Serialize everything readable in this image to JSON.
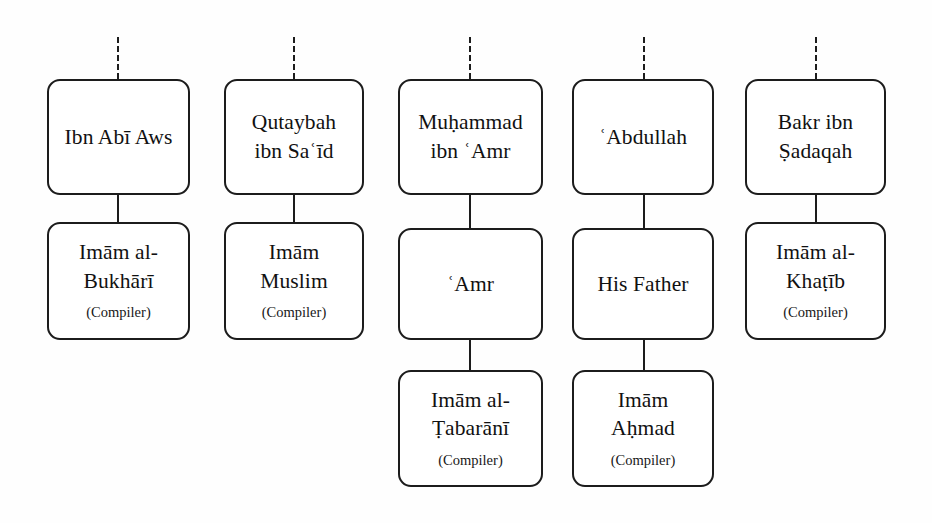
{
  "diagram": {
    "type": "isnad-chain-diagram",
    "background_color": "#fefefe",
    "box_border_color": "#1c1c1c",
    "box_fill_color": "#ffffff",
    "text_color": "#111111",
    "role_label": "(Compiler)",
    "chains": [
      {
        "id": "chain-1",
        "nodes": [
          {
            "name": "Ibn Abī Aws",
            "role": ""
          },
          {
            "name": "Imām al-\nBukhārī",
            "role": "(Compiler)"
          }
        ]
      },
      {
        "id": "chain-2",
        "nodes": [
          {
            "name": "Qutaybah\nibn Saʿīd",
            "role": ""
          },
          {
            "name": "Imām\nMuslim",
            "role": "(Compiler)"
          }
        ]
      },
      {
        "id": "chain-3",
        "nodes": [
          {
            "name": "Muḥammad\nibn ʿAmr",
            "role": ""
          },
          {
            "name": "ʿAmr",
            "role": ""
          },
          {
            "name": "Imām al-\nṬabarānī",
            "role": "(Compiler)"
          }
        ]
      },
      {
        "id": "chain-4",
        "nodes": [
          {
            "name": "ʿAbdullah",
            "role": ""
          },
          {
            "name": "His Father",
            "role": ""
          },
          {
            "name": "Imām\nAḥmad",
            "role": "(Compiler)"
          }
        ]
      },
      {
        "id": "chain-5",
        "nodes": [
          {
            "name": "Bakr ibn\nṢadaqah",
            "role": ""
          },
          {
            "name": "Imām al-\nKhaṭīb",
            "role": "(Compiler)"
          }
        ]
      }
    ]
  }
}
